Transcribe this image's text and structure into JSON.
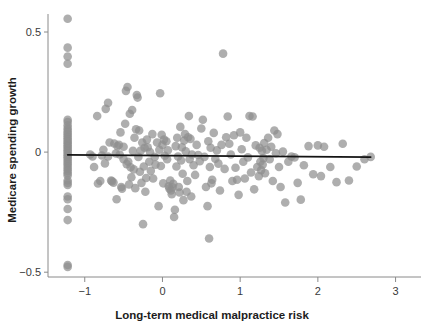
{
  "chart_data": {
    "type": "scatter",
    "title": "",
    "xlabel": "Long-term medical malpractice risk",
    "ylabel": "Medicare spending growth",
    "xlim": [
      -1.37,
      3.25
    ],
    "ylim": [
      -0.52,
      0.575
    ],
    "xticks": [
      -1,
      0,
      1,
      2,
      3
    ],
    "xticklabels": [
      "−1",
      "0",
      "1",
      "2",
      "3"
    ],
    "yticks": [
      0.5,
      0,
      -0.5
    ],
    "yticklabels": [
      "0.5",
      "0",
      "−0.5"
    ],
    "grid": false,
    "legend": null,
    "marker": {
      "shape": "circle",
      "color": "#8f8f8f",
      "opacity": 0.72,
      "radius_px": 4.3
    },
    "fit_line": {
      "label": "linear fit",
      "color": "#141414",
      "x_start": -1.22,
      "y_start": -0.0115,
      "x_end": 2.68,
      "y_end": -0.0205,
      "slope": -0.0023,
      "intercept": -0.0143
    },
    "points": [
      [
        -1.22,
        0.555
      ],
      [
        -1.22,
        0.435
      ],
      [
        -1.22,
        0.398
      ],
      [
        -1.22,
        0.368
      ],
      [
        -1.22,
        0.135
      ],
      [
        -1.22,
        0.125
      ],
      [
        -1.22,
        0.112
      ],
      [
        -1.22,
        0.1
      ],
      [
        -1.22,
        0.092
      ],
      [
        -1.22,
        0.083
      ],
      [
        -1.22,
        0.074
      ],
      [
        -1.22,
        0.066
      ],
      [
        -1.22,
        0.058
      ],
      [
        -1.22,
        0.05
      ],
      [
        -1.22,
        0.043
      ],
      [
        -1.22,
        0.036
      ],
      [
        -1.22,
        0.028
      ],
      [
        -1.22,
        0.021
      ],
      [
        -1.22,
        0.014
      ],
      [
        -1.22,
        0.007
      ],
      [
        -1.22,
        0.0
      ],
      [
        -1.22,
        -0.007
      ],
      [
        -1.22,
        -0.014
      ],
      [
        -1.22,
        -0.021
      ],
      [
        -1.22,
        -0.029
      ],
      [
        -1.22,
        -0.037
      ],
      [
        -1.22,
        -0.045
      ],
      [
        -1.22,
        -0.053
      ],
      [
        -1.22,
        -0.062
      ],
      [
        -1.22,
        -0.07
      ],
      [
        -1.22,
        -0.079
      ],
      [
        -1.22,
        -0.088
      ],
      [
        -1.22,
        -0.097
      ],
      [
        -1.22,
        -0.118
      ],
      [
        -1.22,
        -0.128
      ],
      [
        -1.22,
        -0.137
      ],
      [
        -1.22,
        -0.185
      ],
      [
        -1.22,
        -0.196
      ],
      [
        -1.22,
        -0.237
      ],
      [
        -1.22,
        -0.283
      ],
      [
        -1.22,
        -0.47
      ],
      [
        -1.22,
        -0.478
      ],
      [
        -0.93,
        -0.01
      ],
      [
        -0.9,
        -0.018
      ],
      [
        -0.88,
        -0.062
      ],
      [
        -0.84,
        0.15
      ],
      [
        -0.83,
        -0.131
      ],
      [
        -0.8,
        -0.12
      ],
      [
        -0.78,
        -0.014
      ],
      [
        -0.76,
        0.01
      ],
      [
        -0.74,
        -0.047
      ],
      [
        -0.73,
        0.18
      ],
      [
        -0.7,
        0.205
      ],
      [
        -0.7,
        -0.018
      ],
      [
        -0.68,
        0.04
      ],
      [
        -0.66,
        -0.118
      ],
      [
        -0.65,
        -0.122
      ],
      [
        -0.63,
        -0.127
      ],
      [
        -0.62,
        0.036
      ],
      [
        -0.6,
        -0.006
      ],
      [
        -0.59,
        -0.196
      ],
      [
        -0.58,
        0.025
      ],
      [
        -0.56,
        0.03
      ],
      [
        -0.55,
        -0.01
      ],
      [
        -0.54,
        0.082
      ],
      [
        -0.53,
        -0.145
      ],
      [
        -0.52,
        -0.152
      ],
      [
        -0.5,
        0.022
      ],
      [
        -0.5,
        -0.03
      ],
      [
        -0.48,
        0.118
      ],
      [
        -0.47,
        0.255
      ],
      [
        -0.46,
        -0.05
      ],
      [
        -0.45,
        0.271
      ],
      [
        -0.44,
        -0.04
      ],
      [
        -0.43,
        -0.135
      ],
      [
        -0.42,
        0.16
      ],
      [
        -0.41,
        -0.063
      ],
      [
        -0.4,
        -0.105
      ],
      [
        -0.39,
        0.175
      ],
      [
        -0.38,
        0.005
      ],
      [
        -0.37,
        -0.072
      ],
      [
        -0.36,
        0.06
      ],
      [
        -0.35,
        -0.15
      ],
      [
        -0.34,
        0.095
      ],
      [
        -0.33,
        0.238
      ],
      [
        -0.32,
        0.227
      ],
      [
        -0.31,
        -0.02
      ],
      [
        -0.3,
        0.09
      ],
      [
        -0.29,
        -0.082
      ],
      [
        -0.28,
        0.006
      ],
      [
        -0.27,
        -0.128
      ],
      [
        -0.26,
        0.04
      ],
      [
        -0.25,
        -0.3
      ],
      [
        -0.24,
        -0.06
      ],
      [
        -0.23,
        0.018
      ],
      [
        -0.22,
        -0.165
      ],
      [
        -0.21,
        -0.108
      ],
      [
        -0.2,
        0.052
      ],
      [
        -0.19,
        0.02
      ],
      [
        -0.17,
        -0.04
      ],
      [
        -0.16,
        0.0
      ],
      [
        -0.15,
        -0.078
      ],
      [
        -0.13,
        0.075
      ],
      [
        -0.12,
        -0.11
      ],
      [
        -0.1,
        -0.02
      ],
      [
        -0.09,
        -0.052
      ],
      [
        -0.07,
        0.04
      ],
      [
        -0.05,
        -0.225
      ],
      [
        -0.04,
        0.01
      ],
      [
        -0.03,
        0.245
      ],
      [
        -0.02,
        -0.058
      ],
      [
        -0.01,
        0.072
      ],
      [
        0.0,
        0.03
      ],
      [
        0.01,
        -0.13
      ],
      [
        0.02,
        0.052
      ],
      [
        0.03,
        -0.015
      ],
      [
        0.05,
        0.045
      ],
      [
        0.06,
        -0.03
      ],
      [
        0.07,
        0.008
      ],
      [
        0.08,
        -0.142
      ],
      [
        0.09,
        -0.152
      ],
      [
        0.1,
        -0.118
      ],
      [
        0.11,
        -0.16
      ],
      [
        0.12,
        -0.175
      ],
      [
        0.13,
        -0.147
      ],
      [
        0.14,
        -0.132
      ],
      [
        0.15,
        -0.27
      ],
      [
        0.16,
        -0.24
      ],
      [
        0.17,
        0.025
      ],
      [
        0.18,
        -0.06
      ],
      [
        0.19,
        0.06
      ],
      [
        0.2,
        -0.018
      ],
      [
        0.21,
        -0.145
      ],
      [
        0.22,
        -0.168
      ],
      [
        0.23,
        0.105
      ],
      [
        0.24,
        -0.035
      ],
      [
        0.25,
        0.02
      ],
      [
        0.26,
        -0.09
      ],
      [
        0.27,
        -0.2
      ],
      [
        0.28,
        0.048
      ],
      [
        0.29,
        0.075
      ],
      [
        0.3,
        0.003
      ],
      [
        0.31,
        -0.165
      ],
      [
        0.32,
        -0.12
      ],
      [
        0.33,
        0.062
      ],
      [
        0.34,
        0.15
      ],
      [
        0.35,
        -0.03
      ],
      [
        0.36,
        0.055
      ],
      [
        0.37,
        -0.185
      ],
      [
        0.38,
        -0.01
      ],
      [
        0.4,
        -0.055
      ],
      [
        0.42,
        -0.095
      ],
      [
        0.44,
        0.03
      ],
      [
        0.46,
        -0.012
      ],
      [
        0.48,
        -0.038
      ],
      [
        0.5,
        0.098
      ],
      [
        0.52,
        0.135
      ],
      [
        0.54,
        -0.02
      ],
      [
        0.56,
        -0.145
      ],
      [
        0.58,
        -0.225
      ],
      [
        0.59,
        0.045
      ],
      [
        0.6,
        -0.36
      ],
      [
        0.61,
        -0.062
      ],
      [
        0.62,
        0.018
      ],
      [
        0.63,
        -0.13
      ],
      [
        0.64,
        -0.115
      ],
      [
        0.66,
        0.08
      ],
      [
        0.68,
        -0.028
      ],
      [
        0.7,
        0.007
      ],
      [
        0.72,
        -0.048
      ],
      [
        0.74,
        -0.16
      ],
      [
        0.76,
        0.03
      ],
      [
        0.78,
        0.41
      ],
      [
        0.8,
        -0.07
      ],
      [
        0.82,
        0.062
      ],
      [
        0.84,
        0.148
      ],
      [
        0.86,
        0.035
      ],
      [
        0.88,
        -0.01
      ],
      [
        0.9,
        -0.12
      ],
      [
        0.92,
        0.07
      ],
      [
        0.94,
        -0.065
      ],
      [
        0.96,
        -0.115
      ],
      [
        0.98,
        -0.178
      ],
      [
        1.0,
        0.082
      ],
      [
        1.02,
        0.012
      ],
      [
        1.04,
        -0.04
      ],
      [
        1.06,
        -0.11
      ],
      [
        1.08,
        0.06
      ],
      [
        1.1,
        -0.022
      ],
      [
        1.12,
        0.15
      ],
      [
        1.14,
        -0.085
      ],
      [
        1.16,
        0.148
      ],
      [
        1.18,
        -0.155
      ],
      [
        1.2,
        0.028
      ],
      [
        1.22,
        -0.062
      ],
      [
        1.24,
        -0.1
      ],
      [
        1.25,
        0.018
      ],
      [
        1.26,
        -0.04
      ],
      [
        1.27,
        -0.075
      ],
      [
        1.28,
        0.005
      ],
      [
        1.29,
        -0.052
      ],
      [
        1.3,
        -0.025
      ],
      [
        1.31,
        0.038
      ],
      [
        1.32,
        -0.088
      ],
      [
        1.34,
        0.01
      ],
      [
        1.36,
        0.06
      ],
      [
        1.38,
        -0.03
      ],
      [
        1.4,
        0.022
      ],
      [
        1.42,
        -0.12
      ],
      [
        1.44,
        0.09
      ],
      [
        1.46,
        -0.005
      ],
      [
        1.48,
        0.075
      ],
      [
        1.5,
        -0.062
      ],
      [
        1.52,
        -0.145
      ],
      [
        1.55,
        0.002
      ],
      [
        1.58,
        -0.21
      ],
      [
        1.62,
        -0.04
      ],
      [
        1.66,
        -0.018
      ],
      [
        1.7,
        -0.022
      ],
      [
        1.74,
        -0.128
      ],
      [
        1.78,
        -0.198
      ],
      [
        1.82,
        -0.055
      ],
      [
        1.88,
        0.025
      ],
      [
        1.94,
        -0.092
      ],
      [
        2.0,
        0.028
      ],
      [
        2.04,
        -0.1
      ],
      [
        2.08,
        0.022
      ],
      [
        2.16,
        -0.062
      ],
      [
        2.24,
        -0.125
      ],
      [
        2.32,
        0.035
      ],
      [
        2.4,
        -0.118
      ],
      [
        2.5,
        -0.06
      ],
      [
        2.6,
        -0.03
      ],
      [
        2.68,
        -0.02
      ]
    ]
  }
}
